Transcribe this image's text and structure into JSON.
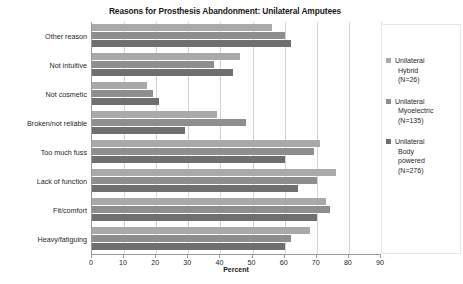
{
  "chart_data": {
    "type": "bar",
    "orientation": "horizontal",
    "title": "Reasons for Prosthesis Abandonment: Unilateral Amputees",
    "xlabel": "Percent",
    "ylabel": "",
    "xlim": [
      0,
      90
    ],
    "xticks": [
      0,
      10,
      20,
      30,
      40,
      50,
      60,
      70,
      80,
      90
    ],
    "grid": true,
    "legend_position": "right",
    "categories": [
      "Other reason",
      "Not intuitive",
      "Not cosmetic",
      "Broken/not reliable",
      "Too much fuss",
      "Lack of function",
      "Fit/comfort",
      "Heavy/fatiguing"
    ],
    "series": [
      {
        "name": "Unilateral Hybrid (N=26)",
        "color": "#a9a9a9",
        "values": [
          56,
          46,
          17,
          39,
          71,
          76,
          73,
          68
        ]
      },
      {
        "name": "Unilateral Myoelectric (N=135)",
        "color": "#8e8e8e",
        "values": [
          60,
          38,
          19,
          48,
          69,
          70,
          74,
          62
        ]
      },
      {
        "name": "Unilateral Body powered (N=276)",
        "color": "#6f6f6f",
        "values": [
          62,
          44,
          21,
          29,
          60,
          64,
          70,
          60
        ]
      }
    ]
  },
  "legend": {
    "items": [
      {
        "line1": "Unilateral",
        "line2": "Hybrid",
        "line3": "(N=26)",
        "line4": ""
      },
      {
        "line1": "Unilateral",
        "line2": "Myoelectric",
        "line3": "(N=135)",
        "line4": ""
      },
      {
        "line1": "Unilateral",
        "line2": "Body",
        "line3": "powered",
        "line4": "(N=276)"
      }
    ]
  }
}
